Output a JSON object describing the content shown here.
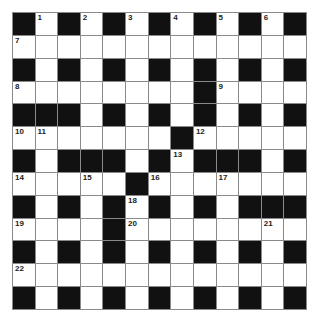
{
  "puzzle": {
    "type": "crossword",
    "rows": 13,
    "cols": 13,
    "colors": {
      "block": "#111111",
      "cell": "#ffffff",
      "gridline": "#8a8a8a",
      "number": "#222222"
    },
    "grid": [
      [
        "#",
        "1",
        "#",
        "2",
        "#",
        "3",
        "#",
        "4",
        "#",
        "5",
        "#",
        "6",
        "#"
      ],
      [
        "7",
        ".",
        ".",
        ".",
        ".",
        ".",
        ".",
        ".",
        ".",
        ".",
        ".",
        ".",
        "."
      ],
      [
        "#",
        ".",
        "#",
        ".",
        "#",
        ".",
        "#",
        ".",
        "#",
        ".",
        "#",
        ".",
        "#"
      ],
      [
        "8",
        ".",
        ".",
        ".",
        ".",
        ".",
        ".",
        ".",
        "#",
        "9",
        ".",
        ".",
        "."
      ],
      [
        "#",
        "#",
        "#",
        ".",
        "#",
        ".",
        "#",
        ".",
        "#",
        ".",
        "#",
        ".",
        "#"
      ],
      [
        "10",
        "11",
        ".",
        ".",
        ".",
        ".",
        ".",
        "#",
        "12",
        ".",
        ".",
        ".",
        "."
      ],
      [
        "#",
        ".",
        "#",
        "#",
        "#",
        ".",
        "#",
        "13",
        "#",
        "#",
        "#",
        ".",
        "#"
      ],
      [
        "14",
        ".",
        ".",
        "15",
        ".",
        "#",
        "16",
        ".",
        ".",
        "17",
        ".",
        ".",
        "."
      ],
      [
        "#",
        ".",
        "#",
        ".",
        "#",
        "18",
        "#",
        ".",
        "#",
        ".",
        "#",
        "#",
        "#"
      ],
      [
        "19",
        ".",
        ".",
        ".",
        "#",
        "20",
        ".",
        ".",
        ".",
        ".",
        ".",
        "21",
        "."
      ],
      [
        "#",
        ".",
        "#",
        ".",
        "#",
        ".",
        "#",
        ".",
        "#",
        ".",
        "#",
        ".",
        "#"
      ],
      [
        "22",
        ".",
        ".",
        ".",
        ".",
        ".",
        ".",
        ".",
        ".",
        ".",
        ".",
        ".",
        "."
      ],
      [
        "#",
        ".",
        "#",
        ".",
        "#",
        ".",
        "#",
        ".",
        "#",
        ".",
        "#",
        ".",
        "#"
      ]
    ],
    "clue_numbers": [
      "1",
      "2",
      "3",
      "4",
      "5",
      "6",
      "7",
      "8",
      "9",
      "10",
      "11",
      "12",
      "13",
      "14",
      "15",
      "16",
      "17",
      "18",
      "19",
      "20",
      "21",
      "22"
    ]
  }
}
